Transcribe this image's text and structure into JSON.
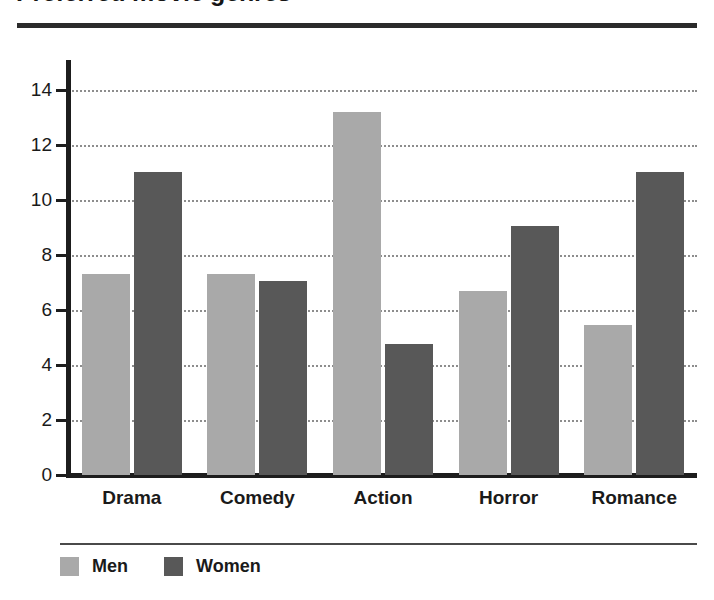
{
  "chart_data": {
    "type": "bar",
    "title": "Preferred movie genres",
    "xlabel": "",
    "ylabel": "",
    "ylim": [
      0,
      15
    ],
    "yticks": [
      0,
      2,
      4,
      6,
      8,
      10,
      12,
      14
    ],
    "grid": true,
    "legend_position": "bottom-left",
    "categories": [
      "Drama",
      "Comedy",
      "Action",
      "Horror",
      "Romance"
    ],
    "series": [
      {
        "name": "Men",
        "color": "#a9a9a9",
        "values": [
          7.3,
          7.3,
          13.2,
          6.7,
          5.45
        ]
      },
      {
        "name": "Women",
        "color": "#585858",
        "values": [
          11.0,
          7.05,
          4.75,
          9.05,
          11.0
        ]
      }
    ]
  },
  "legend": {
    "items": [
      {
        "label": "Men",
        "color": "#a9a9a9"
      },
      {
        "label": "Women",
        "color": "#585858"
      }
    ]
  },
  "colors": {
    "men": "#a9a9a9",
    "women": "#585858",
    "axis": "#1d1d1d",
    "grid": "#8d8d8d",
    "title_rule": "#2b2b2b"
  }
}
